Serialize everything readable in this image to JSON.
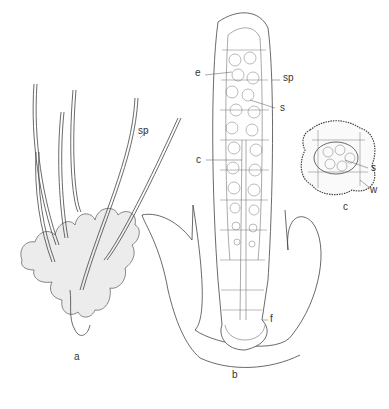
{
  "figure": {
    "panels": [
      {
        "id": "a",
        "label": "a",
        "description": "sporophytes arising from thallus"
      },
      {
        "id": "b",
        "label": "b",
        "description": "longitudinal section of sporophyte in involucre"
      },
      {
        "id": "c",
        "label": "c",
        "description": "transverse section of capsule"
      }
    ],
    "annotations": {
      "a_sp": "sp",
      "b_e": "e",
      "b_sp": "sp",
      "b_s": "s",
      "b_c": "c",
      "b_f": "f",
      "c_s": "s",
      "c_w": "w"
    }
  }
}
